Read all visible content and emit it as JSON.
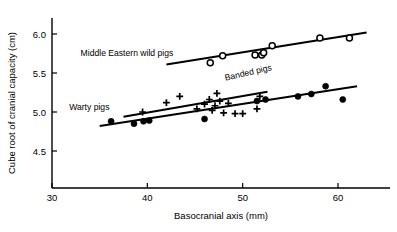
{
  "chart_data": {
    "type": "scatter",
    "title": "",
    "xlabel": "Basocranial axis (mm)",
    "ylabel": "Cube root of cranial capacity (cm)",
    "xlim": [
      27.5,
      65.0
    ],
    "ylim": [
      4.28,
      6.22
    ],
    "xticks": [
      30,
      40,
      50,
      60
    ],
    "xticklabels": [
      "30",
      "40",
      "50",
      "60"
    ],
    "yticks": [
      4.5,
      5.0,
      5.5,
      6.0
    ],
    "yticklabels": [
      "4.5",
      "5.0",
      "5.5",
      "6.0"
    ],
    "grid": false,
    "legend_position": "inline-annotations",
    "annotations": [
      {
        "text": "Middle Eastern wild pigs",
        "x": 33.0,
        "y": 5.72,
        "rotation": 0
      },
      {
        "text": "Banded pigs",
        "x": 48.2,
        "y": 5.4,
        "rotation": -13
      },
      {
        "text": "Warty pigs",
        "x": 31.8,
        "y": 5.02,
        "rotation": 0
      }
    ],
    "series": [
      {
        "name": "Middle Eastern wild pigs",
        "marker": "open-circle",
        "points": [
          {
            "x": 46.6,
            "y": 5.63
          },
          {
            "x": 47.9,
            "y": 5.72
          },
          {
            "x": 51.3,
            "y": 5.73
          },
          {
            "x": 52.0,
            "y": 5.73
          },
          {
            "x": 52.2,
            "y": 5.76
          },
          {
            "x": 53.1,
            "y": 5.85
          },
          {
            "x": 58.1,
            "y": 5.95
          },
          {
            "x": 61.2,
            "y": 5.95
          }
        ],
        "trend": {
          "x1": 42.0,
          "y1": 5.61,
          "x2": 63.0,
          "y2": 6.02
        }
      },
      {
        "name": "Banded pigs",
        "marker": "plus",
        "points": [
          {
            "x": 39.5,
            "y": 5.0
          },
          {
            "x": 42.0,
            "y": 5.12
          },
          {
            "x": 43.4,
            "y": 5.2
          },
          {
            "x": 45.2,
            "y": 5.04
          },
          {
            "x": 46.0,
            "y": 5.1
          },
          {
            "x": 46.5,
            "y": 5.16
          },
          {
            "x": 46.8,
            "y": 5.02
          },
          {
            "x": 47.1,
            "y": 5.08
          },
          {
            "x": 47.3,
            "y": 5.24
          },
          {
            "x": 47.6,
            "y": 5.14
          },
          {
            "x": 48.0,
            "y": 4.99
          },
          {
            "x": 48.5,
            "y": 5.11
          },
          {
            "x": 49.2,
            "y": 4.98
          },
          {
            "x": 50.0,
            "y": 4.98
          },
          {
            "x": 51.5,
            "y": 5.04
          },
          {
            "x": 51.8,
            "y": 5.2
          }
        ],
        "trend": {
          "x1": 37.5,
          "y1": 4.94,
          "x2": 52.6,
          "y2": 5.26
        }
      },
      {
        "name": "Warty pigs",
        "marker": "filled-circle",
        "points": [
          {
            "x": 36.2,
            "y": 4.88
          },
          {
            "x": 38.6,
            "y": 4.85
          },
          {
            "x": 39.6,
            "y": 4.88
          },
          {
            "x": 40.2,
            "y": 4.89
          },
          {
            "x": 46.0,
            "y": 4.91
          },
          {
            "x": 51.5,
            "y": 5.14
          },
          {
            "x": 52.4,
            "y": 5.16
          },
          {
            "x": 55.8,
            "y": 5.2
          },
          {
            "x": 57.2,
            "y": 5.23
          },
          {
            "x": 58.7,
            "y": 5.33
          },
          {
            "x": 60.5,
            "y": 5.16
          }
        ],
        "trend": {
          "x1": 35.0,
          "y1": 4.82,
          "x2": 62.0,
          "y2": 5.33
        }
      }
    ]
  }
}
